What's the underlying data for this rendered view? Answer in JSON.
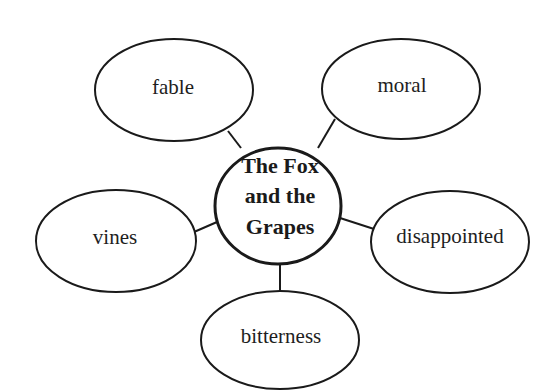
{
  "diagram": {
    "type": "word-web",
    "center": {
      "lines": [
        "The Fox",
        "and the",
        "Grapes"
      ]
    },
    "nodes": [
      {
        "id": "fable",
        "label": "fable"
      },
      {
        "id": "moral",
        "label": "moral"
      },
      {
        "id": "vines",
        "label": "vines"
      },
      {
        "id": "disappointed",
        "label": "disappointed"
      },
      {
        "id": "bitterness",
        "label": "bitterness"
      }
    ],
    "colors": {
      "stroke": "#1a1a1a",
      "background": "#ffffff",
      "text": "#1e1e1e"
    }
  }
}
